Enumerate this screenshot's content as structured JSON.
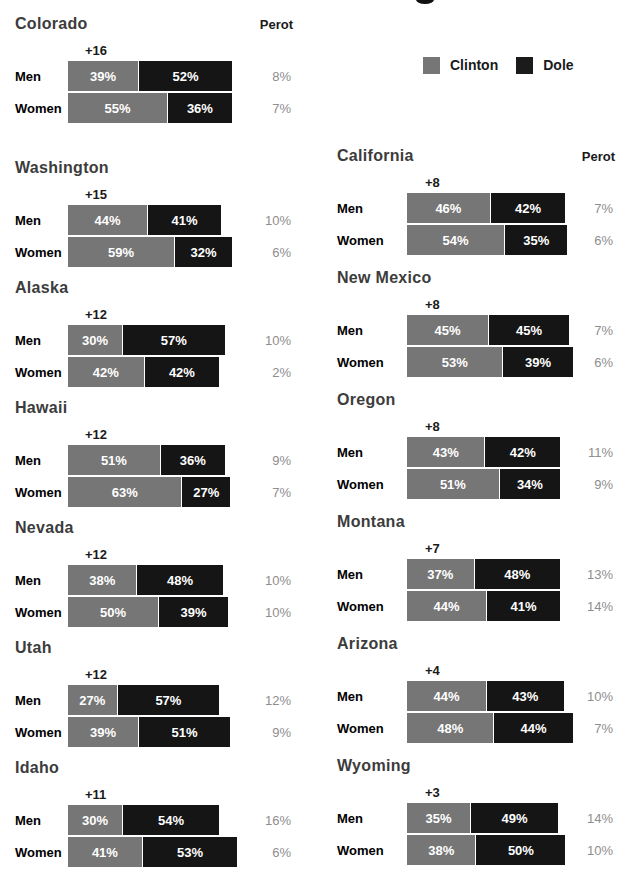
{
  "page": {
    "cropped_title_fragment": "bottom edge of a cut-off headline glyph"
  },
  "labels": {
    "men": "Men",
    "women": "Women",
    "perot_header": "Perot"
  },
  "legend": {
    "items": [
      {
        "label": "Clinton",
        "color": "#767676"
      },
      {
        "label": "Dole",
        "color": "#1b1b1b"
      }
    ]
  },
  "colors": {
    "clinton_bar": "#767676",
    "dole_bar": "#151515",
    "bar_text": "#ffffff",
    "perot_text": "#8e8e8e",
    "state_text": "#3c3c3c",
    "background": "#ffffff"
  },
  "chart_data": {
    "type": "bar",
    "subtype": "horizontal-stacked-grouped-by-state",
    "unit": "percent",
    "series_names": [
      "Clinton",
      "Dole",
      "Perot"
    ],
    "states": [
      {
        "name": "Colorado",
        "column": "left",
        "show_perot_header": true,
        "gap": "+16",
        "rows": [
          {
            "label": "Men",
            "clinton": 39,
            "dole": 52,
            "perot": 8
          },
          {
            "label": "Women",
            "clinton": 55,
            "dole": 36,
            "perot": 7
          }
        ]
      },
      {
        "name": "Washington",
        "column": "left",
        "show_perot_header": false,
        "gap": "+15",
        "rows": [
          {
            "label": "Men",
            "clinton": 44,
            "dole": 41,
            "perot": 10
          },
          {
            "label": "Women",
            "clinton": 59,
            "dole": 32,
            "perot": 6
          }
        ]
      },
      {
        "name": "Alaska",
        "column": "left",
        "show_perot_header": false,
        "gap": "+12",
        "rows": [
          {
            "label": "Men",
            "clinton": 30,
            "dole": 57,
            "perot": 10
          },
          {
            "label": "Women",
            "clinton": 42,
            "dole": 42,
            "perot": 2
          }
        ]
      },
      {
        "name": "Hawaii",
        "column": "left",
        "show_perot_header": false,
        "gap": "+12",
        "rows": [
          {
            "label": "Men",
            "clinton": 51,
            "dole": 36,
            "perot": 9
          },
          {
            "label": "Women",
            "clinton": 63,
            "dole": 27,
            "perot": 7
          }
        ]
      },
      {
        "name": "Nevada",
        "column": "left",
        "show_perot_header": false,
        "gap": "+12",
        "rows": [
          {
            "label": "Men",
            "clinton": 38,
            "dole": 48,
            "perot": 10
          },
          {
            "label": "Women",
            "clinton": 50,
            "dole": 39,
            "perot": 10
          }
        ]
      },
      {
        "name": "Utah",
        "column": "left",
        "show_perot_header": false,
        "gap": "+12",
        "rows": [
          {
            "label": "Men",
            "clinton": 27,
            "dole": 57,
            "perot": 12
          },
          {
            "label": "Women",
            "clinton": 39,
            "dole": 51,
            "perot": 9
          }
        ]
      },
      {
        "name": "Idaho",
        "column": "left",
        "show_perot_header": false,
        "gap": "+11",
        "rows": [
          {
            "label": "Men",
            "clinton": 30,
            "dole": 54,
            "perot": 16
          },
          {
            "label": "Women",
            "clinton": 41,
            "dole": 53,
            "perot": 6
          }
        ]
      },
      {
        "name": "California",
        "column": "right",
        "show_perot_header": true,
        "gap": "+8",
        "rows": [
          {
            "label": "Men",
            "clinton": 46,
            "dole": 42,
            "perot": 7
          },
          {
            "label": "Women",
            "clinton": 54,
            "dole": 35,
            "perot": 6
          }
        ]
      },
      {
        "name": "New Mexico",
        "column": "right",
        "show_perot_header": false,
        "gap": "+8",
        "rows": [
          {
            "label": "Men",
            "clinton": 45,
            "dole": 45,
            "perot": 7
          },
          {
            "label": "Women",
            "clinton": 53,
            "dole": 39,
            "perot": 6
          }
        ]
      },
      {
        "name": "Oregon",
        "column": "right",
        "show_perot_header": false,
        "gap": "+8",
        "rows": [
          {
            "label": "Men",
            "clinton": 43,
            "dole": 42,
            "perot": 11
          },
          {
            "label": "Women",
            "clinton": 51,
            "dole": 34,
            "perot": 9
          }
        ]
      },
      {
        "name": "Montana",
        "column": "right",
        "show_perot_header": false,
        "gap": "+7",
        "rows": [
          {
            "label": "Men",
            "clinton": 37,
            "dole": 48,
            "perot": 13
          },
          {
            "label": "Women",
            "clinton": 44,
            "dole": 41,
            "perot": 14
          }
        ]
      },
      {
        "name": "Arizona",
        "column": "right",
        "show_perot_header": false,
        "gap": "+4",
        "rows": [
          {
            "label": "Men",
            "clinton": 44,
            "dole": 43,
            "perot": 10
          },
          {
            "label": "Women",
            "clinton": 48,
            "dole": 44,
            "perot": 7
          }
        ]
      },
      {
        "name": "Wyoming",
        "column": "right",
        "show_perot_header": false,
        "gap": "+3",
        "rows": [
          {
            "label": "Men",
            "clinton": 35,
            "dole": 49,
            "perot": 14
          },
          {
            "label": "Women",
            "clinton": 38,
            "dole": 50,
            "perot": 10
          }
        ]
      }
    ]
  }
}
